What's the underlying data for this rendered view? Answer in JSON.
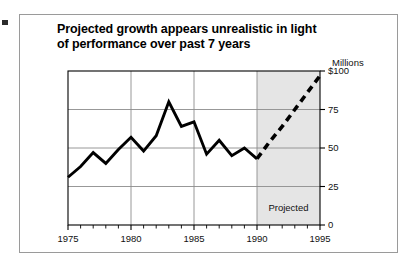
{
  "figure": {
    "title_line1": "Projected growth appears unrealistic in light",
    "title_line2": "of performance over past 7 years",
    "units_label": "Millions",
    "projected_label": "Projected"
  },
  "colors": {
    "frame_border": "#9a9a9a",
    "plot_border": "#000000",
    "gridline": "#8c8c8c",
    "actual_line": "#000000",
    "projected_line": "#000000",
    "projected_band": "#e5e5e5",
    "text": "#000000",
    "background": "#ffffff"
  },
  "chart_data": {
    "type": "line",
    "title": "Projected growth appears unrealistic in light of performance over past 7 years",
    "xlabel": "",
    "ylabel": "Millions",
    "xlim": [
      1975,
      1995
    ],
    "ylim": [
      0,
      100
    ],
    "grid": true,
    "legend": false,
    "xticks": [
      1975,
      1980,
      1985,
      1990,
      1995
    ],
    "xticklabels": [
      "1975",
      "1980",
      "1985",
      "1990",
      "1995"
    ],
    "x_minor_ticks_every": 1,
    "yticks": [
      0,
      25,
      50,
      75,
      100
    ],
    "yticklabels": [
      "0",
      "25",
      "50",
      "75",
      "$100"
    ],
    "annotations": [
      {
        "text": "Millions",
        "position": "above y-axis top"
      },
      {
        "text": "Projected",
        "position": "inside shaded band, lower right"
      }
    ],
    "shaded_region": {
      "x_start": 1990,
      "x_end": 1995,
      "label": "Projected"
    },
    "series": [
      {
        "name": "Actual",
        "style": "solid",
        "x": [
          1975,
          1976,
          1977,
          1978,
          1979,
          1980,
          1981,
          1982,
          1983,
          1984,
          1985,
          1986,
          1987,
          1988,
          1989,
          1990
        ],
        "values": [
          31,
          38,
          47,
          40,
          49,
          57,
          48,
          58,
          80,
          64,
          67,
          46,
          55,
          45,
          50,
          43
        ]
      },
      {
        "name": "Projected",
        "style": "dashed",
        "x": [
          1990,
          1991,
          1992,
          1993,
          1994,
          1995
        ],
        "values": [
          43,
          54,
          64,
          75,
          86,
          97
        ]
      }
    ]
  }
}
